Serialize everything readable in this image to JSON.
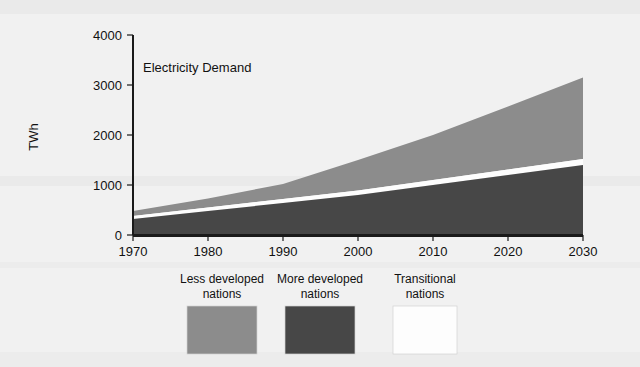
{
  "figure": {
    "background_color": "#f1f1f1"
  },
  "chart_data": {
    "type": "area",
    "stacked": true,
    "title": "Electricity Demand",
    "xlabel": "",
    "ylabel": "TWh",
    "x": [
      1970,
      1980,
      1990,
      2000,
      2010,
      2020,
      2030
    ],
    "xlim": [
      1970,
      2030
    ],
    "ylim": [
      0,
      4000
    ],
    "xticks": [
      1970,
      1980,
      1990,
      2000,
      2010,
      2020,
      2030
    ],
    "yticks": [
      0,
      1000,
      2000,
      3000,
      4000
    ],
    "xticklabels": [
      "1970",
      "1980",
      "1990",
      "2000",
      "2010",
      "2020",
      "2030"
    ],
    "yticklabels": [
      "0",
      "1000",
      "2000",
      "3000",
      "4000"
    ],
    "grid": false,
    "legend_position": "bottom",
    "series": [
      {
        "name": "More developed nations",
        "color": "#474747",
        "values": [
          320,
          480,
          640,
          800,
          1000,
          1200,
          1400
        ]
      },
      {
        "name": "Transitional nations",
        "color": "#fdfdfd",
        "values": [
          60,
          70,
          80,
          90,
          100,
          110,
          120
        ]
      },
      {
        "name": "Less developed nations",
        "color": "#8c8c8c",
        "values": [
          100,
          180,
          300,
          610,
          900,
          1260,
          1630
        ]
      }
    ],
    "stack_totals": [
      480,
      730,
      1020,
      1500,
      2000,
      2570,
      3150
    ],
    "annotations": []
  },
  "legend": {
    "entries": [
      {
        "label_line1": "Less developed",
        "label_line2": "nations",
        "color": "#8c8c8c"
      },
      {
        "label_line1": "More developed",
        "label_line2": "nations",
        "color": "#474747"
      },
      {
        "label_line1": "Transitional",
        "label_line2": "nations",
        "color": "#fdfdfd"
      }
    ]
  }
}
